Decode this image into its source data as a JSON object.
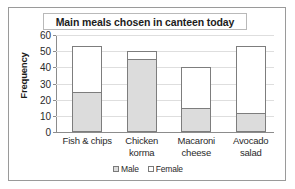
{
  "chart_data": {
    "type": "bar",
    "subtype": "stacked-bar",
    "title": "Main meals chosen in canteen today",
    "xlabel": "",
    "ylabel": "Frequency",
    "ylim": [
      0,
      60
    ],
    "ytick_step": 10,
    "yticks": [
      0,
      10,
      20,
      30,
      40,
      50,
      60
    ],
    "grid": true,
    "legend_position": "bottom-center",
    "categories": [
      "Fish & chips",
      "Chicken korma",
      "Macaroni cheese",
      "Avocado salad"
    ],
    "series": [
      {
        "name": "Male",
        "color": "#dcdcdc",
        "values": [
          25,
          45,
          15,
          12
        ]
      },
      {
        "name": "Female",
        "color": "#ffffff",
        "values": [
          28,
          5,
          25,
          41
        ]
      }
    ],
    "totals": [
      53,
      50,
      40,
      53
    ]
  },
  "category_lines": [
    [
      "Fish & chips",
      ""
    ],
    [
      "Chicken",
      "korma"
    ],
    [
      "Macaroni",
      "cheese"
    ],
    [
      "Avocado",
      "salad"
    ]
  ]
}
